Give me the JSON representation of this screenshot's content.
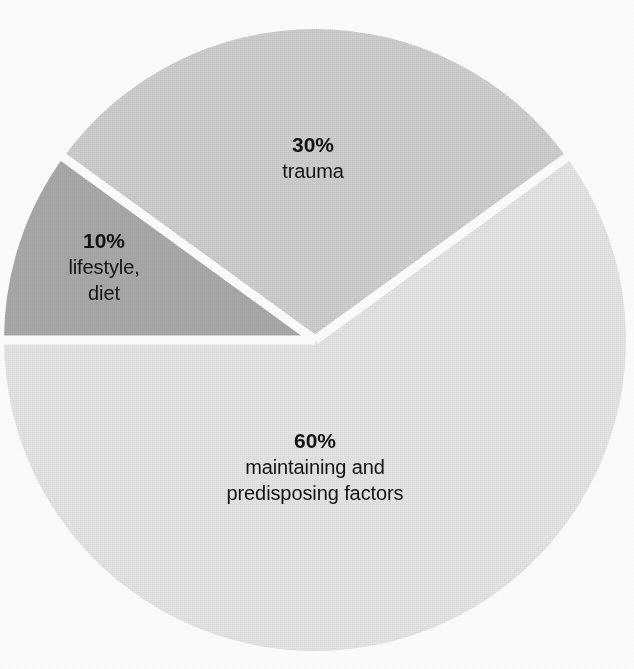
{
  "figure": {
    "background_color": "#ffffff",
    "label_text_color": "#131313",
    "divider_color": "#ffffff"
  },
  "chart_data": {
    "type": "pie",
    "title": "",
    "subtitle": "",
    "xlabel": "",
    "ylabel": "",
    "legend": "none",
    "grid": false,
    "units": "percent",
    "total": 100,
    "categories": [
      "maintaining and predisposing factors",
      "trauma",
      "lifestyle, diet"
    ],
    "values": [
      60,
      30,
      10
    ],
    "slices": [
      {
        "id": "maintaining",
        "percent_label": "60%",
        "value": 60,
        "name_line1": "maintaining and",
        "name_line2": "predisposing factors",
        "color": "#e3e3e3",
        "start_angle_deg": 180,
        "end_angle_deg": 396
      },
      {
        "id": "trauma",
        "percent_label": "30%",
        "value": 30,
        "name_line1": "trauma",
        "name_line2": "",
        "color": "#cdcdcd",
        "start_angle_deg": 36,
        "end_angle_deg": 144
      },
      {
        "id": "lifestyle",
        "percent_label": "10%",
        "value": 10,
        "name_line1": "lifestyle,",
        "name_line2": "diet",
        "color": "#a8a8a8",
        "start_angle_deg": 144,
        "end_angle_deg": 180
      }
    ],
    "geometry": {
      "center_x": 315,
      "center_y": 340,
      "radius": 311,
      "divider_width": 9
    }
  }
}
